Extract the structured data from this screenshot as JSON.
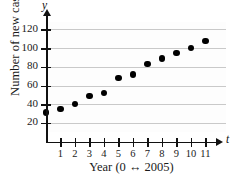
{
  "chart_data": {
    "type": "scatter",
    "title": "",
    "xlabel": "Year (0 ↔ 2005)",
    "ylabel": "Number of new cases",
    "x_axis_variable": "t",
    "y_axis_variable": "y",
    "x": [
      0,
      1,
      2,
      3,
      4,
      5,
      6,
      7,
      8,
      9,
      10,
      11
    ],
    "values": [
      31,
      35,
      40,
      49,
      52,
      68,
      72,
      83,
      89,
      95,
      100,
      108
    ],
    "xlim": [
      0,
      11.8
    ],
    "ylim": [
      0,
      128
    ],
    "x_tick_labels": [
      "1",
      "2",
      "3",
      "4",
      "5",
      "6",
      "7",
      "8",
      "9",
      "10",
      "11"
    ],
    "x_ticks": [
      1,
      2,
      3,
      4,
      5,
      6,
      7,
      8,
      9,
      10,
      11
    ],
    "y_tick_labels": [
      "20",
      "40",
      "60",
      "80",
      "100",
      "120"
    ],
    "y_ticks": [
      20,
      40,
      60,
      80,
      100,
      120
    ],
    "grid": true,
    "grid_axis": "y",
    "legend": null,
    "marker_color": "#000000",
    "gridline_color": "#c9c9c9",
    "axis_color": "#111111",
    "background_color": "#ffffff"
  }
}
